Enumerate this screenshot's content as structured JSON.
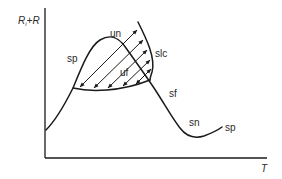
{
  "diagram": {
    "axes": {
      "y_label_main": "R",
      "y_label_sub": "i",
      "y_label_rest": "+R",
      "x_label": "T"
    },
    "labels": {
      "sp_left": "sp",
      "un": "un",
      "slc": "slc",
      "uf": "uf",
      "sf": "sf",
      "sn": "sn",
      "sp_right": "sp"
    },
    "colors": {
      "line": "#1a1a1a",
      "text": "#2a2a2a",
      "background": "#ffffff"
    }
  }
}
